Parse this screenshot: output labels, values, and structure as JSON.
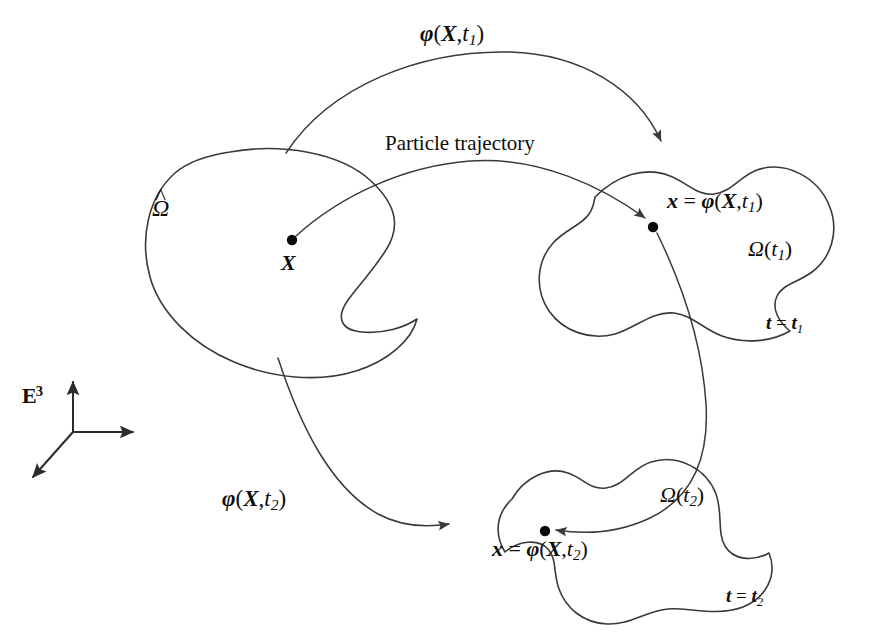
{
  "figure": {
    "domain": "continuum-mechanics-deformation-diagram",
    "background_color": "#ffffff",
    "stroke_color": "#3a3a3a",
    "text_color": "#0d0d0d"
  },
  "labels": {
    "map_t1": {
      "fn": "φ",
      "open": "(",
      "arg": "X",
      "comma": ",",
      "var": "t",
      "sub": "1",
      "close": ")"
    },
    "map_t2": {
      "fn": "φ",
      "open": "(",
      "arg": "X",
      "comma": ",",
      "var": "t",
      "sub": "2",
      "close": ")"
    },
    "trajectory": "Particle trajectory",
    "reference_body": {
      "symbol": "Ω",
      "accent": "̂",
      "full": "Ω̂"
    },
    "material_point": "X",
    "spatial_point_t1": {
      "lhs": "x",
      "eq": "=",
      "fn": "φ",
      "open": "(",
      "arg": "X",
      "comma": ",",
      "var": "t",
      "sub": "1",
      "close": ")"
    },
    "spatial_point_t2": {
      "lhs": "x",
      "eq": "=",
      "fn": "φ",
      "open": "(",
      "arg": "X",
      "comma": ",",
      "var": "t",
      "sub": "2",
      "close": ")"
    },
    "current_body_t1": {
      "symbol": "Ω",
      "open": "(",
      "var": "t",
      "sub": "1",
      "close": ")"
    },
    "current_body_t2": {
      "symbol": "Ω",
      "open": "(",
      "var": "t",
      "sub": "2",
      "close": ")"
    },
    "time_t1": {
      "var": "t",
      "eq": "=",
      "val": "t",
      "sub": "1"
    },
    "time_t2": {
      "var": "t",
      "eq": "=",
      "val": "t",
      "sub": "2"
    },
    "ambient_space": {
      "symbol": "ᴇ",
      "letter": "E",
      "sup": "3"
    }
  },
  "geometry": {
    "reference_blob_label_position": "left",
    "current_blob_t1_label_position": "upper-right",
    "current_blob_t2_label_position": "lower-right",
    "dots": [
      {
        "name": "material-point-X",
        "cx": 292,
        "cy": 240,
        "r": 5.2
      },
      {
        "name": "spatial-point-t1",
        "cx": 653,
        "cy": 227,
        "r": 5.2
      },
      {
        "name": "spatial-point-t2",
        "cx": 545,
        "cy": 531,
        "r": 5.2
      }
    ],
    "arrows": [
      {
        "name": "phi-t1-arc",
        "from": "reference-body",
        "to": "current-body-t1"
      },
      {
        "name": "phi-t2-arc",
        "from": "reference-body",
        "to": "current-body-t2"
      },
      {
        "name": "trajectory-curve",
        "from": "material-point-X",
        "through": "spatial-point-t1",
        "to": "spatial-point-t2"
      }
    ],
    "axes": [
      {
        "name": "axis-vertical",
        "direction": "up"
      },
      {
        "name": "axis-horizontal",
        "direction": "right"
      },
      {
        "name": "axis-oblique",
        "direction": "down-left"
      }
    ]
  }
}
